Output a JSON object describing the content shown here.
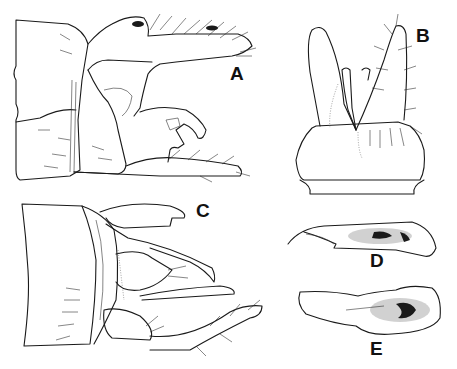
{
  "figure": {
    "type": "scientific illustration plate",
    "panels": [
      {
        "id": "A",
        "label": "A",
        "view": "lateral"
      },
      {
        "id": "B",
        "label": "B",
        "view": "ventral"
      },
      {
        "id": "C",
        "label": "C",
        "view": "dorsal"
      },
      {
        "id": "D",
        "label": "D",
        "view": "phallus lateral"
      },
      {
        "id": "E",
        "label": "E",
        "view": "phallus dorsal"
      }
    ],
    "colors": {
      "background": "#ffffff",
      "ink": "#1a1a1a"
    }
  }
}
